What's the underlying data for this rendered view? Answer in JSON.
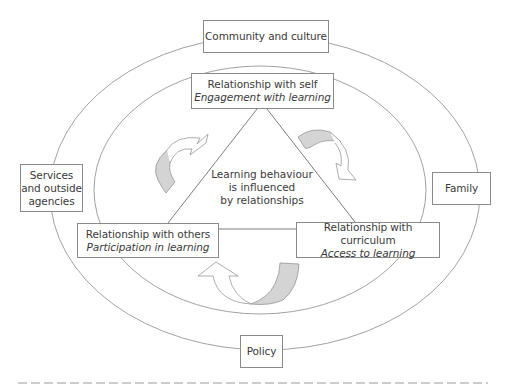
{
  "diagram": {
    "outer_ring": {
      "community": "Community and culture",
      "services": [
        "Services",
        "and outside",
        "agencies"
      ],
      "family": "Family",
      "policy": "Policy"
    },
    "relationships": {
      "self": {
        "title": "Relationship with self",
        "subtitle": "Engagement with learning"
      },
      "others": {
        "title": "Relationship with others",
        "subtitle": "Participation in learning"
      },
      "curriculum": {
        "title": "Relationship with curriculum",
        "subtitle": "Access to learning"
      }
    },
    "center": [
      "Learning behaviour",
      "is influenced",
      "by relationships"
    ],
    "arrows": [
      {
        "name": "left-cycle-arrow",
        "position": "left of triangle"
      },
      {
        "name": "right-cycle-arrow",
        "position": "right of triangle"
      },
      {
        "name": "bottom-cycle-arrow",
        "position": "below triangle"
      }
    ],
    "colors": {
      "stroke": "#8a8a8a",
      "arrow_fill_shaded": "#d4d4d4",
      "arrow_fill_light": "#ffffff",
      "text": "#3a3a3a"
    }
  }
}
